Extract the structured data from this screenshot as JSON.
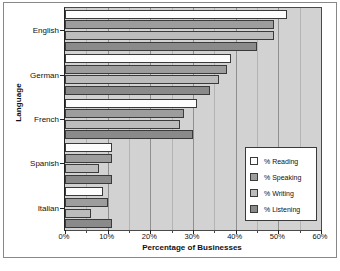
{
  "chart_data": {
    "type": "bar",
    "orientation": "horizontal",
    "title": "",
    "xlabel": "Percentage of Businesses",
    "ylabel": "Language",
    "categories": [
      "English",
      "German",
      "French",
      "Spanish",
      "Italian"
    ],
    "series": [
      {
        "name": "% Reading",
        "color": "#fdfdfd",
        "values": [
          52,
          39,
          31,
          11,
          9
        ]
      },
      {
        "name": "% Speaking",
        "color": "#9d9d9d",
        "values": [
          49,
          38,
          28,
          11,
          10
        ]
      },
      {
        "name": "% Writing",
        "color": "#bcbcbc",
        "values": [
          49,
          36,
          27,
          8,
          6
        ]
      },
      {
        "name": "% Listening",
        "color": "#8a8a8a",
        "values": [
          45,
          34,
          30,
          11,
          11
        ]
      }
    ],
    "xlim": [
      0,
      60
    ],
    "xticks": [
      0,
      10,
      20,
      30,
      40,
      50,
      60
    ],
    "xticklabels": [
      "0%",
      "10%",
      "20%",
      "30%",
      "40%",
      "50%",
      "60%"
    ],
    "xtick_step": 10,
    "minor_xtick_step": 5,
    "grid": "vertical",
    "legend_position": "center-right",
    "plot_background": "#d2d2d2",
    "figure_background": "#ffffff"
  },
  "legend": {
    "entries": [
      {
        "label": "% Reading"
      },
      {
        "label": "% Speaking"
      },
      {
        "label": "% Writing"
      },
      {
        "label": "% Listening"
      }
    ]
  },
  "caption": {
    "cutoff_text": ""
  }
}
